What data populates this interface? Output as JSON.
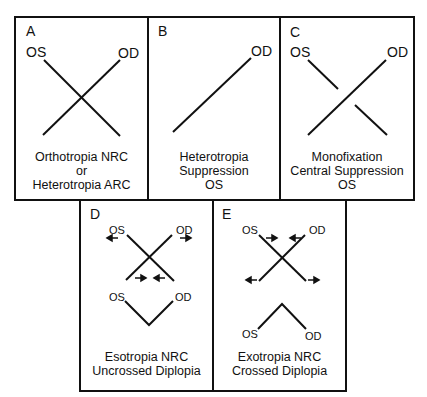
{
  "panels": {
    "A": {
      "letter": "A",
      "os": "OS",
      "od": "OD",
      "caption": [
        "Orthotropia NRC",
        "or",
        "Heterotropia ARC"
      ]
    },
    "B": {
      "letter": "B",
      "od": "OD",
      "caption": [
        "Heterotropia",
        "Suppression",
        "OS"
      ]
    },
    "C": {
      "letter": "C",
      "os": "OS",
      "od": "OD",
      "caption": [
        "Monofixation",
        "Central Suppression",
        "OS"
      ]
    },
    "D": {
      "letter": "D",
      "os_top": "OS",
      "od_top": "OD",
      "os_bottom": "OS",
      "od_bottom": "OD",
      "caption": [
        "Esotropia NRC",
        "Uncrossed Diplopia"
      ]
    },
    "E": {
      "letter": "E",
      "os_top": "OS",
      "od_top": "OD",
      "os_bottom": "OS",
      "od_bottom": "OD",
      "caption": [
        "Exotropia NRC",
        "Crossed Diplopia"
      ]
    }
  },
  "colors": {
    "line": "#111111",
    "background": "#ffffff"
  }
}
